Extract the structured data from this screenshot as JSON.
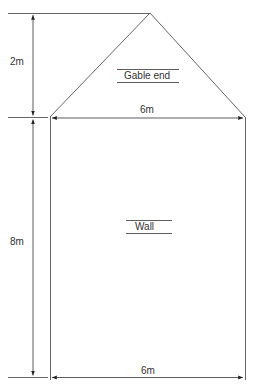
{
  "diagram": {
    "gable": {
      "label": "Gable end",
      "height_label": "2m",
      "width_label": "6m"
    },
    "wall": {
      "label": "Wall",
      "height_label": "8m",
      "width_label": "6m"
    },
    "colors": {
      "line": "#555555",
      "text": "#333333"
    }
  }
}
